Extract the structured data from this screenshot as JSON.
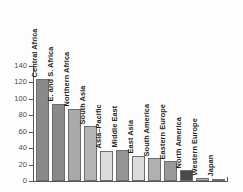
{
  "chart_data": {
    "type": "bar",
    "title": "",
    "subtitle": "",
    "xlabel": "",
    "ylabel": "",
    "ylim": [
      0,
      140
    ],
    "grid": false,
    "legend": "none",
    "orientation": "vertical",
    "categories": [
      "Central Africa",
      "E. and S. Africa",
      "Northern Africa",
      "South Asia",
      "Asia–Pacific",
      "Middle East",
      "East Asia",
      "South America",
      "Eastern Europe",
      "North America",
      "Western Europe",
      "Japan"
    ],
    "values": [
      124,
      94,
      88,
      67,
      37,
      38,
      31,
      28,
      24,
      13,
      4,
      3
    ],
    "bar_colors": [
      "#8a8a8a",
      "#8a8a8a",
      "#a9a9a9",
      "#b4b4b4",
      "#dcdcdc",
      "#949494",
      "#dcdcdc",
      "#b0b0b0",
      "#9a9a9a",
      "#4a4a4a",
      "#b4b4b4",
      "#c4c4c4"
    ],
    "ytick_labels": [
      "140",
      "120",
      "100",
      "80",
      "60",
      "40",
      "20",
      "0"
    ],
    "ytick_values": [
      140,
      120,
      100,
      80,
      60,
      40,
      20,
      0
    ],
    "axis_color": "#555555"
  }
}
